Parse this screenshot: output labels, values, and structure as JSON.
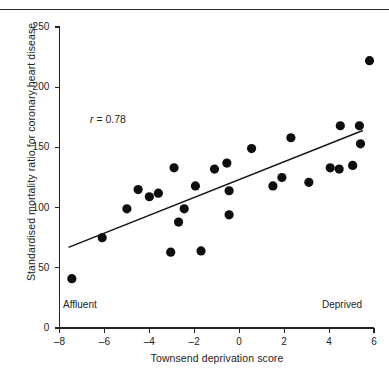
{
  "figure": {
    "kind": "scatter-plot",
    "background": "#ffffff",
    "ink_color": "#151515"
  },
  "annotations": {
    "correlation_prefix": "r",
    "correlation_text": " = 0.78",
    "affluent_label": "Affluent",
    "deprived_label": "Deprived"
  },
  "chart_data": {
    "type": "scatter",
    "title": "",
    "xlabel": "Townsend deprivation score",
    "ylabel": "Standardised mortality ratio for coronary heart disease",
    "xlim": [
      -8,
      6
    ],
    "ylim": [
      0,
      250
    ],
    "xticks": [
      -8,
      -6,
      -4,
      -2,
      0,
      2,
      4,
      6
    ],
    "xticklabels": [
      "–8",
      "–6",
      "–4",
      "–2",
      "0",
      "2",
      "4",
      "6"
    ],
    "yticks": [
      0,
      50,
      100,
      150,
      200,
      250
    ],
    "yticklabels": [
      "0",
      "50",
      "100",
      "150",
      "200",
      "250"
    ],
    "grid": false,
    "legend": false,
    "annotations": [
      {
        "text": "r = 0.78",
        "x": -6.6,
        "y": 178
      },
      {
        "text": "Affluent",
        "x": -7.8,
        "y": 24
      },
      {
        "text": "Deprived",
        "x": 3.7,
        "y": 24
      }
    ],
    "series": [
      {
        "name": "Electoral wards",
        "marker": "filled-circle",
        "marker_color": "#0d0d0d",
        "marker_size": 4.6,
        "points": [
          {
            "x": -7.45,
            "y": 41
          },
          {
            "x": -6.1,
            "y": 75
          },
          {
            "x": -5.0,
            "y": 99
          },
          {
            "x": -4.5,
            "y": 115
          },
          {
            "x": -4.0,
            "y": 109
          },
          {
            "x": -3.6,
            "y": 112
          },
          {
            "x": -3.05,
            "y": 63
          },
          {
            "x": -2.9,
            "y": 133
          },
          {
            "x": -2.45,
            "y": 99
          },
          {
            "x": -2.7,
            "y": 88
          },
          {
            "x": -1.95,
            "y": 118
          },
          {
            "x": -1.7,
            "y": 64
          },
          {
            "x": -1.1,
            "y": 132
          },
          {
            "x": -0.55,
            "y": 137
          },
          {
            "x": -0.45,
            "y": 114
          },
          {
            "x": -0.45,
            "y": 94
          },
          {
            "x": 0.55,
            "y": 149
          },
          {
            "x": 1.5,
            "y": 118
          },
          {
            "x": 1.9,
            "y": 125
          },
          {
            "x": 2.3,
            "y": 158
          },
          {
            "x": 3.1,
            "y": 121
          },
          {
            "x": 4.05,
            "y": 133
          },
          {
            "x": 4.45,
            "y": 132
          },
          {
            "x": 4.5,
            "y": 168
          },
          {
            "x": 5.05,
            "y": 135
          },
          {
            "x": 5.35,
            "y": 168
          },
          {
            "x": 5.4,
            "y": 153
          },
          {
            "x": 5.8,
            "y": 222
          }
        ]
      }
    ],
    "fit_line": {
      "name": "regression-line",
      "x_start": -7.6,
      "y_start": 67,
      "x_end": 5.5,
      "y_end": 164
    }
  }
}
